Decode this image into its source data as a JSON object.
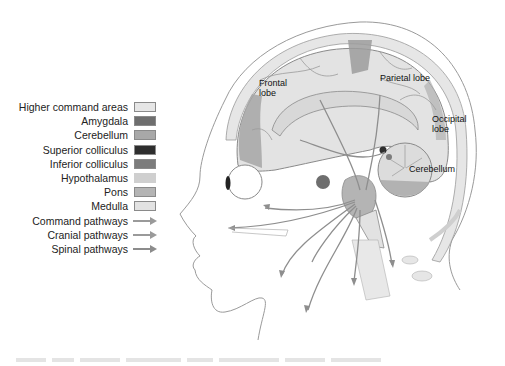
{
  "figure": {
    "brain_labels": {
      "frontal": [
        "Frontal",
        "lobe"
      ],
      "parietal": "Parietal lobe",
      "occipital": [
        "Occipital",
        "lobe"
      ],
      "cerebellum": "Cerebellum"
    }
  },
  "legend": {
    "items": [
      {
        "label": "Higher command areas",
        "type": "swatch",
        "color": "#e6e6e6"
      },
      {
        "label": "Amygdala",
        "type": "swatch",
        "color": "#6e6e6e"
      },
      {
        "label": "Cerebellum",
        "type": "swatch",
        "color": "#a8a8a8"
      },
      {
        "label": "Superior colliculus",
        "type": "swatch",
        "color": "#2e2e2e"
      },
      {
        "label": "Inferior colliculus",
        "type": "swatch",
        "color": "#7c7c7c"
      },
      {
        "label": "Hypothalamus",
        "type": "swatch",
        "color": "#cfcfcf"
      },
      {
        "label": "Pons",
        "type": "swatch",
        "color": "#b4b4b4"
      },
      {
        "label": "Medulla",
        "type": "swatch",
        "color": "#e2e2e2"
      },
      {
        "label": "Command pathways",
        "type": "arrow",
        "color": "#9a9a9a"
      },
      {
        "label": "Cranial pathways",
        "type": "arrow",
        "color": "#9a9a9a"
      },
      {
        "label": "Spinal pathways",
        "type": "arrow",
        "color": "#8c8c8c"
      }
    ]
  },
  "colors": {
    "outline": "#9a9a9a",
    "cortex": "#e3e3e3",
    "cortex_dark": "#9c9c9c",
    "pathway": "#8e8e8e",
    "skull": "#d9d9d9"
  }
}
